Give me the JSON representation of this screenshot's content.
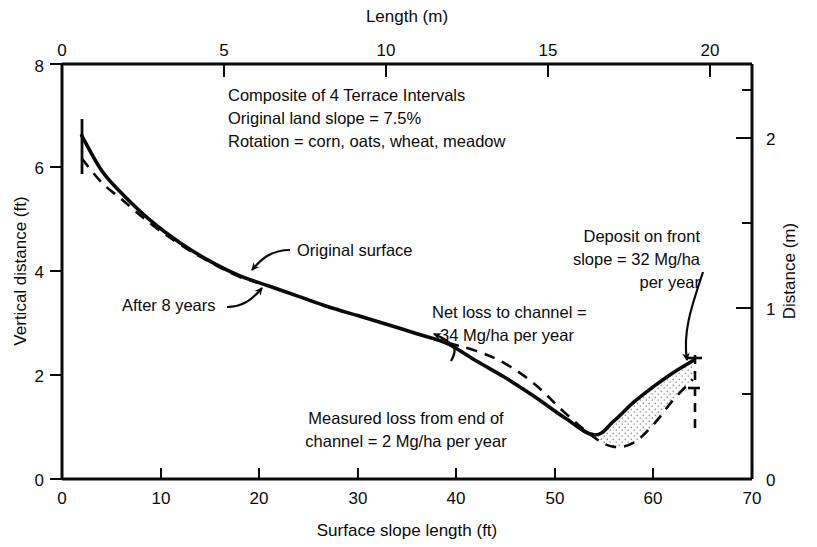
{
  "chart_data": {
    "type": "line",
    "title": "",
    "xlabel": "Surface slope length (ft)",
    "ylabel": "Vertical distance (ft)",
    "xlabel_top": "Length (m)",
    "ylabel_right": "Distance (m)",
    "xlim": [
      0,
      70
    ],
    "ylim": [
      0,
      8
    ],
    "xlim_top": [
      0,
      21.336
    ],
    "ylim_right": [
      0,
      2.4384
    ],
    "grid": false,
    "legend_position": "inline-annotations",
    "xticks": [
      0,
      10,
      20,
      30,
      40,
      50,
      60,
      70
    ],
    "xtick_labels": [
      "0",
      "10",
      "20",
      "30",
      "40",
      "50",
      "60",
      "70"
    ],
    "yticks": [
      0,
      2,
      4,
      6,
      8
    ],
    "ytick_labels": [
      "0",
      "2",
      "4",
      "6",
      "8"
    ],
    "xticks_top": [
      0,
      5,
      10,
      15,
      20
    ],
    "xtick_labels_top": [
      "0",
      "5",
      "10",
      "15",
      "20"
    ],
    "yticks_right": [
      0,
      1,
      2
    ],
    "ytick_labels_right": [
      "0",
      "1",
      "2"
    ],
    "yticks_right_minor": [
      0.5,
      1.5,
      2.5
    ],
    "series": [
      {
        "name": "Original surface",
        "style": "dashed",
        "points": [
          [
            2.0,
            6.18
          ],
          [
            4.0,
            5.72
          ],
          [
            6.0,
            5.4
          ],
          [
            9.0,
            4.92
          ],
          [
            12.0,
            4.52
          ],
          [
            15.0,
            4.18
          ],
          [
            18.0,
            3.9
          ],
          [
            21.0,
            3.72
          ],
          [
            24.0,
            3.52
          ],
          [
            27.0,
            3.32
          ],
          [
            30.0,
            3.15
          ],
          [
            33.0,
            2.98
          ],
          [
            36.0,
            2.8
          ],
          [
            39.0,
            2.63
          ],
          [
            42.0,
            2.47
          ],
          [
            45.0,
            2.22
          ],
          [
            48.0,
            1.82
          ],
          [
            51.0,
            1.28
          ],
          [
            54.0,
            0.8
          ],
          [
            56.0,
            0.62
          ],
          [
            58.0,
            0.7
          ],
          [
            60.0,
            1.05
          ],
          [
            62.0,
            1.52
          ],
          [
            64.0,
            1.92
          ]
        ]
      },
      {
        "name": "After 8 years",
        "style": "solid",
        "points": [
          [
            2.0,
            6.62
          ],
          [
            4.0,
            5.95
          ],
          [
            6.0,
            5.52
          ],
          [
            9.0,
            4.98
          ],
          [
            12.0,
            4.55
          ],
          [
            15.0,
            4.2
          ],
          [
            18.0,
            3.92
          ],
          [
            21.0,
            3.72
          ],
          [
            24.0,
            3.52
          ],
          [
            27.0,
            3.32
          ],
          [
            30.0,
            3.15
          ],
          [
            33.0,
            2.98
          ],
          [
            36.0,
            2.8
          ],
          [
            39.0,
            2.62
          ],
          [
            42.0,
            2.28
          ],
          [
            45.0,
            1.95
          ],
          [
            48.0,
            1.58
          ],
          [
            51.0,
            1.18
          ],
          [
            54.0,
            0.85
          ],
          [
            56.0,
            1.12
          ],
          [
            58.0,
            1.48
          ],
          [
            60.0,
            1.78
          ],
          [
            62.0,
            2.05
          ],
          [
            64.0,
            2.28
          ]
        ]
      }
    ],
    "fill_regions": [
      {
        "name": "deposit-on-front-slope",
        "pattern": "stipple",
        "between": [
          "After 8 years",
          "Original surface"
        ],
        "x_range": [
          54.5,
          64.0
        ]
      }
    ],
    "markers": [
      {
        "name": "terrace-ridge-left",
        "x": 2.0,
        "y_top": 7.05,
        "y_bottom": 6.18,
        "style": "solid-vertical-tick"
      },
      {
        "name": "terrace-ridge-right",
        "x": 64.2,
        "y_top": 2.45,
        "y_bottom": 1.25,
        "style": "dashed-vertical-tick"
      }
    ],
    "annotations": [
      {
        "name": "composite-note",
        "lines": [
          "Composite of 4 Terrace Intervals",
          "Original land slope = 7.5%",
          "Rotation = corn, oats, wheat, meadow"
        ],
        "align": "left"
      },
      {
        "name": "original-surface-label",
        "text": "Original surface",
        "leader": "curve-to-left-down"
      },
      {
        "name": "after-8-years-label",
        "text": "After 8 years",
        "leader": "curve-to-right-up"
      },
      {
        "name": "net-loss-label",
        "lines": [
          "Net loss to channel =",
          "34 Mg/ha per year"
        ],
        "align": "left",
        "leader": "arrow-down-left"
      },
      {
        "name": "deposit-label",
        "lines": [
          "Deposit on front",
          "slope = 32 Mg/ha",
          "per year"
        ],
        "align": "right",
        "leader": "long-curve-down"
      },
      {
        "name": "measured-loss-label",
        "lines": [
          "Measured loss from end of",
          "channel = 2  Mg/ha per year"
        ],
        "align": "center",
        "leader": "none"
      }
    ]
  },
  "colors": {
    "background": "#ffffff",
    "ink": "#0a0a0a",
    "stipple": "#b8b8b8"
  }
}
